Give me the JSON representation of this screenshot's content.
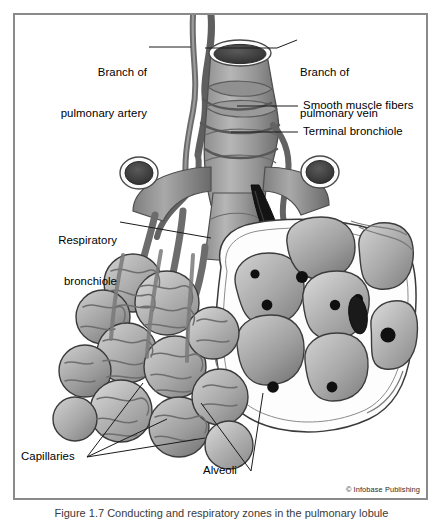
{
  "figure": {
    "frame_border_color": "#8a8a8a",
    "background_color": "#ffffff",
    "copyright": "© Infobase Publishing",
    "caption": "Figure 1.7  Conducting and respiratory zones in the pulmonary lobule"
  },
  "labels": {
    "artery": {
      "line1": "Branch of",
      "line2": "pulmonary artery"
    },
    "vein": {
      "line1": "Branch of",
      "line2": "pulmonary vein"
    },
    "muscle": {
      "text": "Smooth muscle fibers"
    },
    "terminal": {
      "text": "Terminal bronchiole"
    },
    "respiratory": {
      "line1": "Respiratory",
      "line2": "bronchiole"
    },
    "capillaries": {
      "text": "Capillaries"
    },
    "alveoli": {
      "text": "Alveoli"
    }
  },
  "palette": {
    "ink": "#1b1b1b",
    "outline": "#2a2a2a",
    "tissue_light": "#c9c9c9",
    "tissue_mid": "#a3a3a3",
    "tissue_dark": "#7c7c7c",
    "vessel": "#6f6f6f",
    "lumen_dark": "#3a3a3a",
    "lumen_black": "#121212",
    "nucleus": "#101010",
    "membrane_white": "#fbfbfb"
  }
}
